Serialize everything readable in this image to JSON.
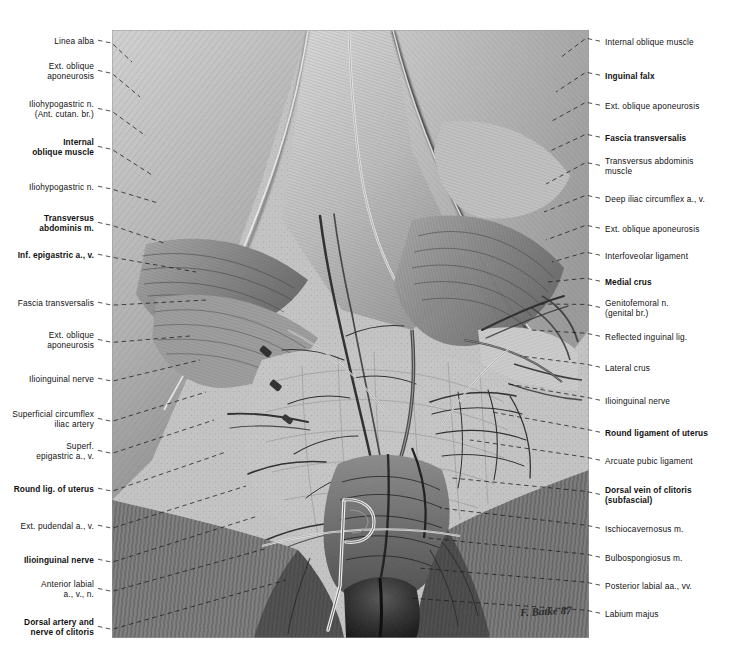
{
  "plate": {
    "title": "Female inguinal region and superficial perineum — dissection",
    "signature": "F. Batke 87",
    "background_color": "#ffffff",
    "illustration": {
      "medium": "graphite / pencil drawing",
      "palette": [
        "#ffffff",
        "#d8d8d8",
        "#b9b9b9",
        "#8f8f8f",
        "#6a6a6a",
        "#3c3c3c",
        "#111111"
      ],
      "bounds": {
        "x": 112,
        "y": 30,
        "width": 477,
        "height": 608
      }
    }
  },
  "labels_left": [
    {
      "text": "Linea alba",
      "bold": false,
      "x": 94,
      "y": 36,
      "tx": 132,
      "ty": 62
    },
    {
      "text": "Ext. oblique\naponeurosis",
      "bold": false,
      "x": 94,
      "y": 61,
      "tx": 140,
      "ty": 97
    },
    {
      "text": "Iliohypogastric n.\n(Ant. cutan. br.)",
      "bold": false,
      "x": 94,
      "y": 99,
      "tx": 146,
      "ty": 136
    },
    {
      "text": "Internal\noblique muscle",
      "bold": true,
      "x": 94,
      "y": 137,
      "tx": 152,
      "ty": 175
    },
    {
      "text": "Iliohypogastric n.",
      "bold": false,
      "x": 94,
      "y": 182,
      "tx": 158,
      "ty": 203
    },
    {
      "text": "Transversus\nabdominis m.",
      "bold": true,
      "x": 94,
      "y": 213,
      "tx": 164,
      "ty": 243
    },
    {
      "text": "Inf. epigastric a., v.",
      "bold": true,
      "x": 94,
      "y": 250,
      "tx": 196,
      "ty": 272
    },
    {
      "text": "Fascia transversalis",
      "bold": false,
      "x": 94,
      "y": 298,
      "tx": 206,
      "ty": 300
    },
    {
      "text": "Ext. oblique\naponeurosis",
      "bold": false,
      "x": 94,
      "y": 330,
      "tx": 190,
      "ty": 336
    },
    {
      "text": "Ilioinguinal nerve",
      "bold": false,
      "x": 94,
      "y": 374,
      "tx": 200,
      "ty": 360
    },
    {
      "text": "Superficial circumflex\niliac artery",
      "bold": false,
      "x": 94,
      "y": 409,
      "tx": 206,
      "ty": 392
    },
    {
      "text": "Superf.\nepigastric a., v.",
      "bold": false,
      "x": 94,
      "y": 441,
      "tx": 214,
      "ty": 420
    },
    {
      "text": "Round lig. of uterus",
      "bold": true,
      "x": 94,
      "y": 484,
      "tx": 226,
      "ty": 452
    },
    {
      "text": "Ext. pudendal a., v.",
      "bold": false,
      "x": 94,
      "y": 521,
      "tx": 246,
      "ty": 486
    },
    {
      "text": "Ilioinguinal nerve",
      "bold": true,
      "x": 94,
      "y": 555,
      "tx": 258,
      "ty": 516
    },
    {
      "text": "Anterior labial\na., v., n.",
      "bold": false,
      "x": 94,
      "y": 579,
      "tx": 268,
      "ty": 548
    },
    {
      "text": "Dorsal artery and\nnerve of clitoris",
      "bold": true,
      "x": 94,
      "y": 617,
      "tx": 286,
      "ty": 580
    }
  ],
  "labels_right": [
    {
      "text": "Internal oblique muscle",
      "bold": false,
      "x": 605,
      "y": 37,
      "tx": 560,
      "ty": 58
    },
    {
      "text": "Inguinal falx",
      "bold": true,
      "x": 605,
      "y": 71,
      "tx": 556,
      "ty": 92
    },
    {
      "text": "Ext. oblique aponeurosis",
      "bold": false,
      "x": 605,
      "y": 101,
      "tx": 552,
      "ty": 121
    },
    {
      "text": "Fascia transversalis",
      "bold": true,
      "x": 605,
      "y": 133,
      "tx": 548,
      "ty": 152
    },
    {
      "text": "Transversus abdominis\nmuscle",
      "bold": false,
      "x": 605,
      "y": 156,
      "tx": 546,
      "ty": 184
    },
    {
      "text": "Deep iliac circumflex a., v.",
      "bold": false,
      "x": 605,
      "y": 194,
      "tx": 544,
      "ty": 212
    },
    {
      "text": "Ext. oblique aponeurosis",
      "bold": false,
      "x": 605,
      "y": 224,
      "tx": 546,
      "ty": 240
    },
    {
      "text": "Interfoveolar ligament",
      "bold": false,
      "x": 605,
      "y": 251,
      "tx": 552,
      "ty": 262
    },
    {
      "text": "Medial crus",
      "bold": true,
      "x": 605,
      "y": 277,
      "tx": 548,
      "ty": 282
    },
    {
      "text": "Genitofemoral n.\n(genital br.)",
      "bold": false,
      "x": 605,
      "y": 298,
      "tx": 540,
      "ty": 304
    },
    {
      "text": "Reflected inguinal lig.",
      "bold": false,
      "x": 605,
      "y": 332,
      "tx": 530,
      "ty": 330
    },
    {
      "text": "Lateral crus",
      "bold": false,
      "x": 605,
      "y": 363,
      "tx": 520,
      "ty": 356
    },
    {
      "text": "Ilioinguinal nerve",
      "bold": false,
      "x": 605,
      "y": 396,
      "tx": 508,
      "ty": 384
    },
    {
      "text": "Round ligament of uterus",
      "bold": true,
      "x": 605,
      "y": 428,
      "tx": 492,
      "ty": 412
    },
    {
      "text": "Arcuate pubic ligament",
      "bold": false,
      "x": 605,
      "y": 456,
      "tx": 470,
      "ty": 440
    },
    {
      "text": "Dorsal vein of clitoris\n(subfascial)",
      "bold": true,
      "x": 605,
      "y": 485,
      "tx": 452,
      "ty": 478
    },
    {
      "text": "Ischiocavernosus m.",
      "bold": false,
      "x": 605,
      "y": 524,
      "tx": 440,
      "ty": 508
    },
    {
      "text": "Bulbospongiosus m.",
      "bold": false,
      "x": 605,
      "y": 553,
      "tx": 428,
      "ty": 538
    },
    {
      "text": "Posterior labial aa., vv.",
      "bold": false,
      "x": 605,
      "y": 581,
      "tx": 418,
      "ty": 568
    },
    {
      "text": "Labium majus",
      "bold": false,
      "x": 605,
      "y": 609,
      "tx": 408,
      "ty": 598
    }
  ]
}
